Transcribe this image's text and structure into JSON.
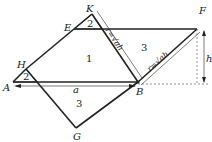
{
  "diagram": {
    "points": {
      "K": {
        "label": "K",
        "x": 92,
        "y": 14
      },
      "E": {
        "label": "E",
        "x": 74,
        "y": 29
      },
      "F": {
        "label": "F",
        "x": 197,
        "y": 29
      },
      "H": {
        "label": "H",
        "x": 26,
        "y": 69
      },
      "A": {
        "label": "A",
        "x": 13,
        "y": 82
      },
      "B": {
        "label": "B",
        "x": 138,
        "y": 82
      },
      "G": {
        "label": "G",
        "x": 76,
        "y": 128
      }
    },
    "regions": {
      "region_1": "1",
      "region_2_top": "2",
      "region_2_left": "2",
      "region_3_right": "3",
      "region_3_bottom": "3"
    },
    "dimensions": {
      "a_label": "a",
      "h_label": "h",
      "r_label_left": "r=√ah",
      "r_label_right": "r=√ah"
    }
  }
}
